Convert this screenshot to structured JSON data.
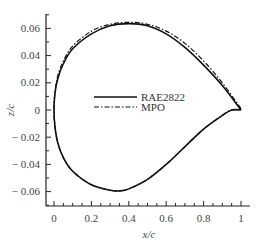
{
  "chart_data": {
    "type": "line",
    "title": "",
    "xlabel": "x/c",
    "ylabel": "z/c",
    "xlim": [
      -0.04,
      1.05
    ],
    "ylim": [
      -0.07,
      0.07
    ],
    "xticks": [
      "0",
      "0.2",
      "0.4",
      "0.6",
      "0.8",
      "1"
    ],
    "yticks": [
      "-0.06",
      "-0.04",
      "-0.02",
      "0",
      "0.02",
      "0.04",
      "0.06"
    ],
    "grid": false,
    "legend_position": "center",
    "series": [
      {
        "name": "RAE2822",
        "style": "solid",
        "upper": [
          [
            0,
            0
          ],
          [
            0.005,
            0.012
          ],
          [
            0.02,
            0.023
          ],
          [
            0.05,
            0.034
          ],
          [
            0.1,
            0.045
          ],
          [
            0.2,
            0.056
          ],
          [
            0.3,
            0.062
          ],
          [
            0.4,
            0.0635
          ],
          [
            0.5,
            0.062
          ],
          [
            0.6,
            0.056
          ],
          [
            0.7,
            0.046
          ],
          [
            0.8,
            0.033
          ],
          [
            0.9,
            0.018
          ],
          [
            1.0,
            0.0
          ]
        ],
        "lower": [
          [
            0,
            0
          ],
          [
            0.005,
            -0.012
          ],
          [
            0.02,
            -0.024
          ],
          [
            0.05,
            -0.035
          ],
          [
            0.1,
            -0.045
          ],
          [
            0.2,
            -0.055
          ],
          [
            0.3,
            -0.059
          ],
          [
            0.35,
            -0.0595
          ],
          [
            0.4,
            -0.058
          ],
          [
            0.5,
            -0.051
          ],
          [
            0.6,
            -0.04
          ],
          [
            0.7,
            -0.027
          ],
          [
            0.8,
            -0.014
          ],
          [
            0.9,
            -0.004
          ],
          [
            0.95,
            0.0
          ],
          [
            1.0,
            0.0
          ]
        ]
      },
      {
        "name": "MPO",
        "style": "dash-dot",
        "upper": [
          [
            0,
            0
          ],
          [
            0.005,
            0.013
          ],
          [
            0.02,
            0.025
          ],
          [
            0.05,
            0.036
          ],
          [
            0.1,
            0.047
          ],
          [
            0.2,
            0.058
          ],
          [
            0.3,
            0.063
          ],
          [
            0.4,
            0.0645
          ],
          [
            0.5,
            0.063
          ],
          [
            0.6,
            0.058
          ],
          [
            0.7,
            0.049
          ],
          [
            0.8,
            0.036
          ],
          [
            0.9,
            0.02
          ],
          [
            1.0,
            0.001
          ]
        ],
        "lower": [
          [
            0,
            0
          ],
          [
            0.005,
            -0.012
          ],
          [
            0.02,
            -0.024
          ],
          [
            0.05,
            -0.035
          ],
          [
            0.1,
            -0.045
          ],
          [
            0.2,
            -0.055
          ],
          [
            0.3,
            -0.059
          ],
          [
            0.35,
            -0.0595
          ],
          [
            0.4,
            -0.058
          ],
          [
            0.5,
            -0.051
          ],
          [
            0.6,
            -0.04
          ],
          [
            0.7,
            -0.027
          ],
          [
            0.8,
            -0.014
          ],
          [
            0.9,
            -0.004
          ],
          [
            0.95,
            0.0
          ],
          [
            1.0,
            0.0
          ]
        ]
      }
    ]
  },
  "axes": {
    "x_title": "x/c",
    "y_title": "z/c",
    "x_tick_labels": [
      "0",
      "0.2",
      "0.4",
      "0.6",
      "0.8",
      "1"
    ],
    "y_tick_labels": [
      "0.06",
      "0.04",
      "0.02",
      "0",
      "− 0.02",
      "− 0.04",
      "− 0.06"
    ]
  },
  "legend": {
    "items": [
      {
        "label": "RAE2822"
      },
      {
        "label": "MPO"
      }
    ]
  }
}
